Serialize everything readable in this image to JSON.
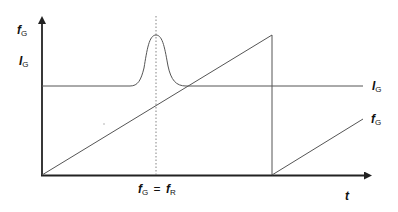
{
  "diagram": {
    "type": "signal-timing-diagram",
    "axes": {
      "y_labels": [
        {
          "symbol": "f",
          "subscript": "G"
        },
        {
          "symbol": "I",
          "subscript": "G"
        }
      ],
      "x_label": {
        "symbol": "t"
      }
    },
    "curves": [
      {
        "name": "current",
        "label": {
          "symbol": "I",
          "subscript": "G"
        },
        "shape": "flat line with resonance peak"
      },
      {
        "name": "frequency",
        "label": {
          "symbol": "f",
          "subscript": "G"
        },
        "shape": "sawtooth ramp"
      }
    ],
    "markers": [
      {
        "name": "resonance",
        "label": {
          "lhs_symbol": "f",
          "lhs_sub": "G",
          "eq": "=",
          "rhs_symbol": "f",
          "rhs_sub": "R"
        },
        "style": "dotted vertical"
      }
    ],
    "colors": {
      "axis": "#222222",
      "curve": "#555555",
      "marker": "#777777"
    }
  }
}
